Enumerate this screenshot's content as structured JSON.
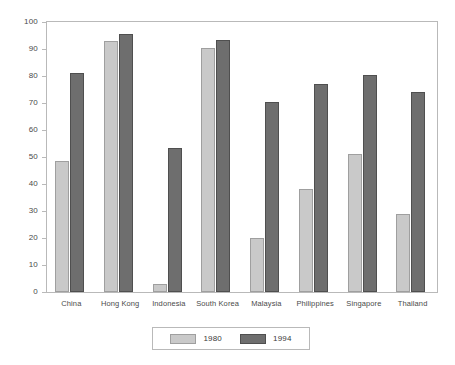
{
  "chart_data": {
    "type": "bar",
    "title": "",
    "subtitle": "",
    "xlabel": "",
    "ylabel": "",
    "ylim": [
      0,
      100
    ],
    "ytick_step": 10,
    "yticks": [
      100,
      90,
      80,
      70,
      60,
      50,
      40,
      30,
      20,
      10,
      0
    ],
    "grid": false,
    "legend_position": "bottom-center",
    "categories": [
      "China",
      "Hong Kong",
      "Indonesia",
      "South Korea",
      "Malaysia",
      "Philippines",
      "Singapore",
      "Thailand"
    ],
    "series": [
      {
        "name": "1980",
        "color": "#c9c9c9",
        "values": [
          48.5,
          93.0,
          3.0,
          90.5,
          20.0,
          38.0,
          51.0,
          29.0
        ]
      },
      {
        "name": "1994",
        "color": "#6e6e6e",
        "values": [
          81.0,
          95.5,
          53.5,
          93.5,
          70.5,
          77.0,
          80.5,
          74.0
        ]
      }
    ],
    "annotations": []
  },
  "legend": {
    "entries": [
      {
        "label": "1980",
        "color": "#c9c9c9"
      },
      {
        "label": "1994",
        "color": "#6e6e6e"
      }
    ]
  },
  "style": {
    "background": "#ffffff",
    "axis_color": "#b9b9b9",
    "text_color": "#3a3a3a"
  }
}
